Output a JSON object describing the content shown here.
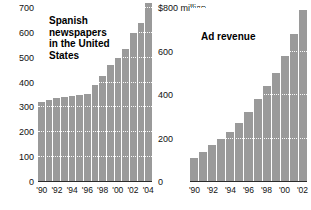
{
  "chart_data": [
    {
      "type": "bar",
      "title": "Spanish newspapers in the United States",
      "title_lines": "Spanish\nnewspapers\nin the United\nStates",
      "xlabel": "",
      "ylabel": "",
      "ylim": [
        0,
        700
      ],
      "yticks": [
        0,
        100,
        200,
        300,
        400,
        500,
        600,
        700
      ],
      "ytick_labels": [
        "0",
        "100",
        "200",
        "300",
        "400",
        "500",
        "600",
        "700"
      ],
      "grid": true,
      "legend": "none",
      "categories": [
        "1990",
        "1991",
        "1992",
        "1993",
        "1994",
        "1995",
        "1996",
        "1997",
        "1998",
        "1999",
        "2000",
        "2001",
        "2002",
        "2003",
        "2004"
      ],
      "xtick_labels": [
        "'90",
        "'92",
        "'94",
        "'96",
        "'98",
        "'00",
        "'02",
        "'04"
      ],
      "values": [
        320,
        330,
        338,
        344,
        348,
        352,
        355,
        390,
        425,
        470,
        500,
        535,
        600,
        640,
        720
      ]
    },
    {
      "type": "bar",
      "title": "Ad revenue",
      "title_lines": "Ad revenue",
      "xlabel": "",
      "ylabel": "$800 million",
      "ylim": [
        0,
        800
      ],
      "yticks": [
        0,
        200,
        400,
        600,
        800
      ],
      "ytick_labels": [
        "0",
        "200",
        "400",
        "600",
        "$800 million"
      ],
      "grid": true,
      "legend": "none",
      "categories": [
        "1990",
        "1991",
        "1992",
        "1993",
        "1994",
        "1995",
        "1996",
        "1997",
        "1998",
        "1999",
        "2000",
        "2001",
        "2002"
      ],
      "xtick_labels": [
        "'90",
        "'92",
        "'94",
        "'96",
        "'98",
        "'00",
        "'02"
      ],
      "values": [
        111,
        140,
        168,
        196,
        232,
        272,
        320,
        380,
        440,
        500,
        580,
        680,
        790
      ]
    }
  ],
  "style": {
    "bar_color": "#9a9a9a",
    "grid_color": "#ffffff",
    "axis_color": "#2b2b2b",
    "text_color": "#111111",
    "background": "#ffffff"
  }
}
